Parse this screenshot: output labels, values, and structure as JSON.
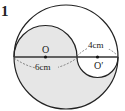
{
  "problem_number": "1",
  "labels": {
    "center_left": "O",
    "center_right": "O′",
    "left_diameter": "6cm",
    "right_diameter": "4cm"
  },
  "colors": {
    "shade": "#e6e6e6",
    "stroke": "#222222",
    "number_box": "#555555"
  }
}
